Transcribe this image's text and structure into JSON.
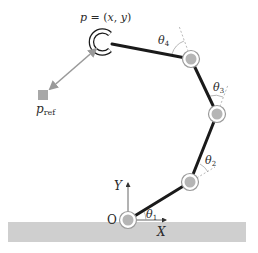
{
  "diagram": {
    "title": "",
    "colors": {
      "background": "#ffffff",
      "ground": "#cfcfcf",
      "link": "#1a1a1a",
      "joint_fill": "#b5b5b5",
      "joint_ring": "#9a9a9a",
      "arrow": "#9a9a9a",
      "ref_square": "#a8a8a8",
      "axis": "#555555",
      "dashed": "#9a9a9a"
    },
    "ground": {
      "x": 8,
      "y": 222,
      "width": 238,
      "height": 20
    },
    "origin_label": "O",
    "axes": {
      "x_label": "X",
      "y_label": "Y"
    },
    "joints": [
      {
        "id": "j1",
        "x": 128,
        "y": 220
      },
      {
        "id": "j2",
        "x": 190,
        "y": 182
      },
      {
        "id": "j3",
        "x": 217,
        "y": 114
      },
      {
        "id": "j4",
        "x": 191,
        "y": 59
      }
    ],
    "end_effector": {
      "x": 103,
      "y": 42,
      "label_p": "p",
      "label_eq": " = (",
      "label_x": "x",
      "label_comma": ", ",
      "label_y": "y",
      "label_close": ")"
    },
    "reference": {
      "x": 43,
      "y": 95,
      "label_p": "p",
      "label_sub": "ref"
    },
    "angles": [
      {
        "name": "theta1",
        "symbol": "θ",
        "sub": "1",
        "x": 146,
        "y": 218
      },
      {
        "name": "theta2",
        "symbol": "θ",
        "sub": "2",
        "x": 205,
        "y": 164
      },
      {
        "name": "theta3",
        "symbol": "θ",
        "sub": "3",
        "x": 213,
        "y": 91
      },
      {
        "name": "theta4",
        "symbol": "θ",
        "sub": "4",
        "x": 158,
        "y": 44
      }
    ]
  }
}
